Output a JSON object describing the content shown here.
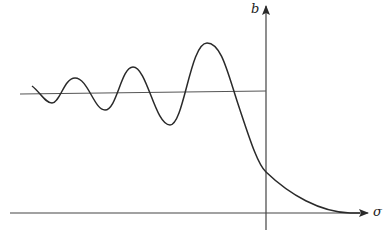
{
  "figure": {
    "type": "function-sketch",
    "axes": {
      "vertical": {
        "label": "b",
        "x": 266,
        "y_top": 5,
        "y_bottom": 230
      },
      "horizontal": {
        "label": "σ",
        "y": 213,
        "x_left": 10,
        "x_right": 370
      }
    },
    "reference_line": {
      "x1": 20,
      "y1": 94,
      "x2": 266,
      "y2": 91
    },
    "curve": {
      "color": "#2a2a2a",
      "points": [
        [
          32,
          86
        ],
        [
          52,
          103
        ],
        [
          75,
          78
        ],
        [
          105,
          110
        ],
        [
          133,
          67
        ],
        [
          170,
          125
        ],
        [
          207,
          43
        ],
        [
          266,
          172
        ],
        [
          350,
          213
        ]
      ]
    },
    "colors": {
      "ink": "#2a2a2a",
      "axis": "#444444",
      "reference_line": "#555555",
      "background": "#ffffff"
    }
  }
}
